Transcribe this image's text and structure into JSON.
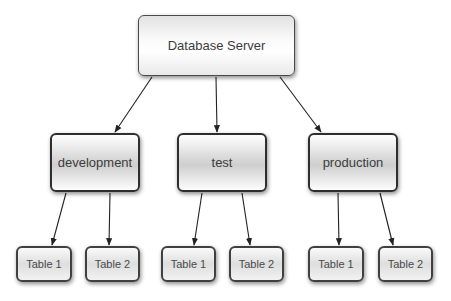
{
  "diagram": {
    "type": "hierarchy-tree",
    "root": {
      "id": "database-server",
      "label": "Database Server"
    },
    "environments": [
      {
        "id": "development",
        "label": "development",
        "tables": [
          {
            "id": "dev-table-1",
            "label": "Table 1"
          },
          {
            "id": "dev-table-2",
            "label": "Table 2"
          }
        ]
      },
      {
        "id": "test",
        "label": "test",
        "tables": [
          {
            "id": "test-table-1",
            "label": "Table 1"
          },
          {
            "id": "test-table-2",
            "label": "Table 2"
          }
        ]
      },
      {
        "id": "production",
        "label": "production",
        "tables": [
          {
            "id": "prod-table-1",
            "label": "Table 1"
          },
          {
            "id": "prod-table-2",
            "label": "Table 2"
          }
        ]
      }
    ],
    "edges": [
      {
        "from": "database-server",
        "to": "development"
      },
      {
        "from": "database-server",
        "to": "test"
      },
      {
        "from": "database-server",
        "to": "production"
      },
      {
        "from": "development",
        "to": "dev-table-1"
      },
      {
        "from": "development",
        "to": "dev-table-2"
      },
      {
        "from": "test",
        "to": "test-table-1"
      },
      {
        "from": "test",
        "to": "test-table-2"
      },
      {
        "from": "production",
        "to": "prod-table-1"
      },
      {
        "from": "production",
        "to": "prod-table-2"
      }
    ],
    "colors": {
      "background": "#ffffff",
      "border": "#333333",
      "text": "#3c3c3c",
      "edge": "#222222"
    }
  }
}
